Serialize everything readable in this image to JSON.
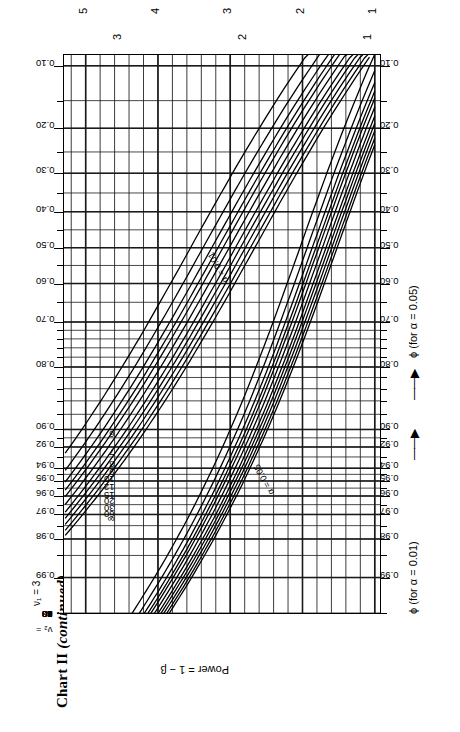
{
  "page": {
    "title_main": "Chart II ",
    "title_italic": "(continued)"
  },
  "chart_data": {
    "type": "line",
    "title": "Chart II (continued)",
    "xlabel_lower": "ϕ (for α = 0.01)",
    "xlabel_upper": "ϕ (for α = 0.05)",
    "ylabel": "Power = 1 − β",
    "nu1_label": "ν₁ = 3",
    "nu2_label": "ν₂ =",
    "alpha_labels": [
      "α = 0.05",
      "α = 0.01"
    ],
    "alpha_values": [
      0.05,
      0.01
    ],
    "power_ticks": [
      "0.99",
      "0.98",
      "0.97",
      "0.96",
      "0.95",
      "0.94",
      "0.92",
      "0.90",
      "0.80",
      "0.70",
      "0.60",
      "0.50",
      "0.40",
      "0.30",
      "0.20",
      "0.10"
    ],
    "power_values": [
      0.99,
      0.98,
      0.97,
      0.96,
      0.95,
      0.94,
      0.92,
      0.9,
      0.8,
      0.7,
      0.6,
      0.5,
      0.4,
      0.3,
      0.2,
      0.1
    ],
    "phi_ticks_alpha01": [
      "1",
      "2",
      "3"
    ],
    "phi_ticks_alpha05": [
      "1",
      "2",
      "3",
      "4",
      "5"
    ],
    "nu2_series": [
      "∞",
      "60",
      "30",
      "20",
      "15",
      "12",
      "10",
      "9",
      "8",
      "7",
      "6"
    ],
    "nu2_values": [
      "inf",
      60,
      30,
      20,
      15,
      12,
      10,
      9,
      8,
      7,
      6
    ],
    "grid": true,
    "legend_position": "inline-curve-labels"
  },
  "labels": {
    "power_axis": "Power = 1 − β",
    "phi_lower": "ϕ (for α = 0.01)",
    "phi_upper": "ϕ (for α = 0.05)",
    "arrow": "——▶",
    "nu1": "ν₁ = 3",
    "nu2_prefix": "ν₂ =",
    "alpha05": "α = 0.05",
    "alpha01": "α = 0.01"
  },
  "colors": {
    "ink": "#000000",
    "grid": "#1a1a1a",
    "paper": "#ffffff"
  }
}
